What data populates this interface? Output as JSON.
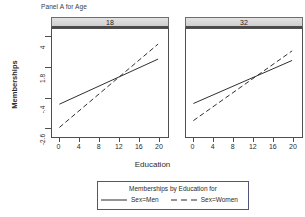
{
  "figure": {
    "caption": "Panel A for Age",
    "ylabel": "Memberships",
    "xlabel": "Education"
  },
  "legend": {
    "title": "Memberships by Education for",
    "entries": [
      {
        "label": "Sex=Men",
        "style": "solid"
      },
      {
        "label": "Sex=Women",
        "style": "dashed"
      }
    ]
  },
  "chart_data": {
    "type": "line",
    "title": "Panel A for Age",
    "xlabel": "Education",
    "ylabel": "Memberships",
    "grid": false,
    "legend_position": "bottom",
    "legend_title": "Memberships by Education for",
    "xlim": [
      -1.5,
      22
    ],
    "ylim": [
      -3.3,
      4.6
    ],
    "xticks": [
      0,
      4,
      8,
      12,
      16,
      20
    ],
    "xticklabels": [
      "0",
      "4",
      "8",
      "12",
      "16",
      "20"
    ],
    "yticks": [
      4,
      1.8,
      -0.4,
      -2.6
    ],
    "yticklabels": [
      "4",
      "1.8",
      "-.4",
      "-2.6"
    ],
    "panel_variable": "Age",
    "panels": [
      {
        "strip_label": "18",
        "series": [
          {
            "name": "Sex=Men",
            "style": "solid",
            "x": [
              0,
              20
            ],
            "y": [
              -0.9,
              2.4
            ]
          },
          {
            "name": "Sex=Women",
            "style": "dashed",
            "x": [
              0,
              20
            ],
            "y": [
              -2.6,
              3.5
            ]
          }
        ]
      },
      {
        "strip_label": "32",
        "series": [
          {
            "name": "Sex=Men",
            "style": "solid",
            "x": [
              0,
              20
            ],
            "y": [
              -0.85,
              2.3
            ]
          },
          {
            "name": "Sex=Women",
            "style": "dashed",
            "x": [
              0,
              20
            ],
            "y": [
              -2.1,
              3.0
            ]
          }
        ]
      }
    ]
  },
  "colors": {
    "line": "#2b2b2b",
    "strip_border": "#6d6d6d",
    "legend_border": "#55557a"
  }
}
